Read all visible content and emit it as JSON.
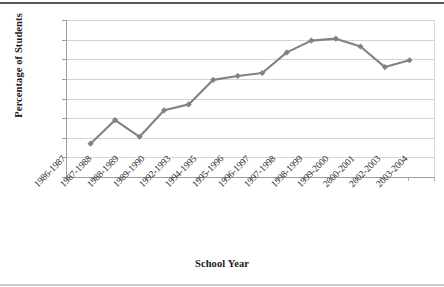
{
  "chart_data": {
    "type": "line",
    "title": "",
    "subtitle": "",
    "xlabel": "School Year",
    "ylabel": "Percentage of Students",
    "categories": [
      "1986-1987",
      "1987-1988",
      "1988-1989",
      "1989-1990",
      "1992-1993",
      "1994-1995",
      "1995-1996",
      "1996-1997",
      "1997-1998",
      "1998-1999",
      "1999-2000",
      "2000-2001",
      "2002-2003",
      "2003-2004"
    ],
    "values": [
      3.4,
      5.8,
      4.1,
      6.8,
      7.4,
      9.9,
      10.3,
      10.6,
      12.7,
      13.9,
      14.1,
      13.3,
      11.2,
      11.9
    ],
    "ylim": [
      0,
      16
    ],
    "ytick_step": 2,
    "yticks": [
      16,
      14,
      12,
      10,
      8,
      6,
      4,
      2,
      0
    ],
    "grid": true,
    "legend": "none",
    "series_color": "#808285",
    "marker": "diamond",
    "gridline_color": "#d3d4d6",
    "axis_color": "#9c9ea1",
    "text_color": "#2b2b2b",
    "background": "#ffffff"
  }
}
